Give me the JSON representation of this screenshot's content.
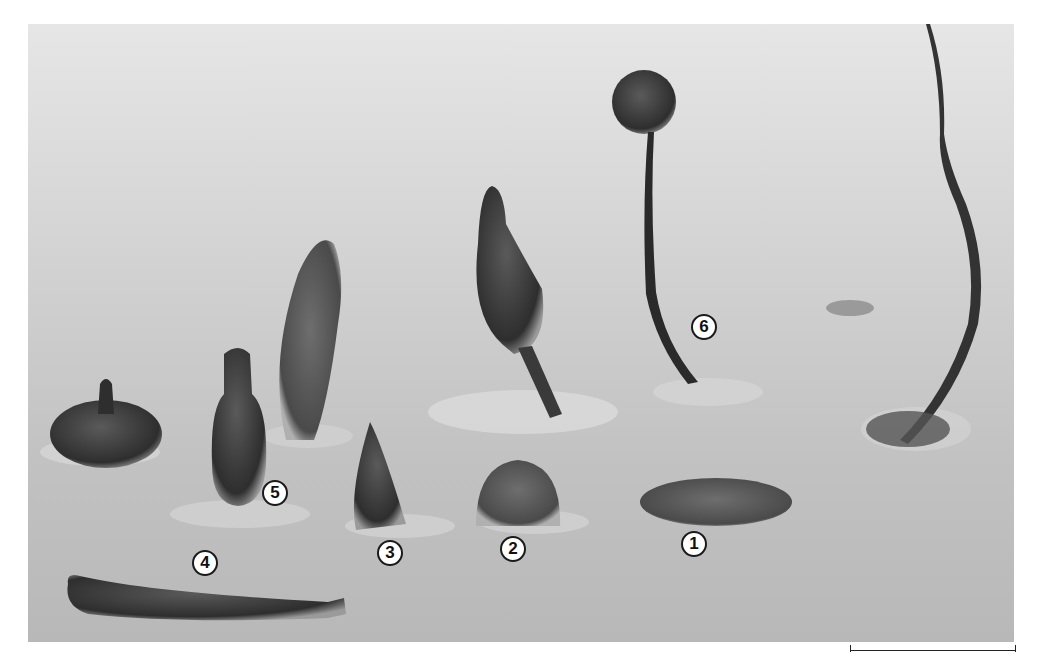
{
  "figure": {
    "labels": [
      {
        "id": "1",
        "text": "1",
        "x": 694,
        "y": 544
      },
      {
        "id": "2",
        "text": "2",
        "x": 513,
        "y": 549
      },
      {
        "id": "3",
        "text": "3",
        "x": 390,
        "y": 553
      },
      {
        "id": "4",
        "text": "4",
        "x": 205,
        "y": 563
      },
      {
        "id": "5",
        "text": "5",
        "x": 275,
        "y": 493
      },
      {
        "id": "6",
        "text": "6",
        "x": 704,
        "y": 327
      }
    ],
    "scale_bar": {
      "visible": true,
      "text": ""
    },
    "colors": {
      "background": "#ffffff",
      "substrate": "#cccccc",
      "specimen": "#3a3a3a",
      "label_fill": "#ffffff",
      "label_border": "#1a1a1a"
    }
  }
}
